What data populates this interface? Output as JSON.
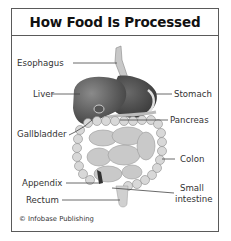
{
  "title": "How Food Is Processed",
  "labels": {
    "esophagus": "Esophagus",
    "liver": "Liver",
    "stomach": "Stomach",
    "pancreas": "Pancreas",
    "gallbladder": "Gallbladder",
    "colon": "Colon",
    "appendix": "Appendix",
    "small_intestine_1": "Small",
    "small_intestine_2": "intestine",
    "rectum": "Rectum"
  },
  "credit": "© Infobase Publishing"
}
